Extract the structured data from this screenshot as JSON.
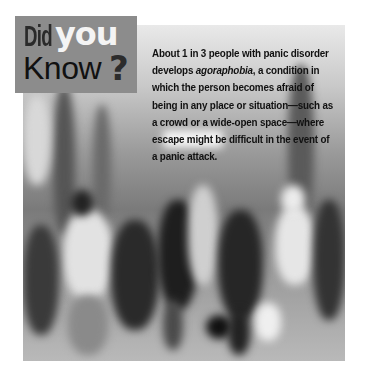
{
  "callout": {
    "word1": "Did",
    "word2": "you",
    "word3": "Know",
    "mark": "?"
  },
  "fact": {
    "before": "About 1 in 3 people with panic disorder develops ",
    "term": "agoraphobia",
    "after": ", a condition in which the person becomes afraid of being in any place or situation—such as a crowd or a wide-open space—where escape might be difficult in the event of a panic attack."
  },
  "photo": {
    "description": "Blurred grayscale photo of a crowd of people walking through a busy indoor space",
    "icon": "photo-image"
  },
  "colors": {
    "callout_bg": "#8c8c8c",
    "did_color": "#2a2a2a",
    "you_color": "#f4f4f4",
    "text_color": "#111111"
  }
}
